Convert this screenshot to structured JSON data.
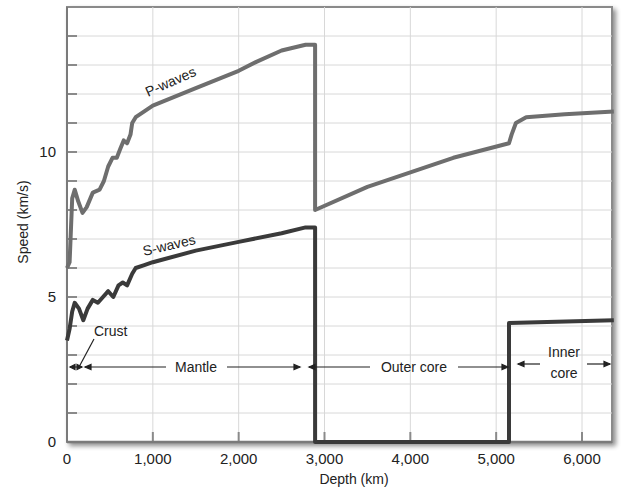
{
  "chart_data": {
    "type": "line",
    "title": "",
    "xlabel": "Depth (km)",
    "ylabel": "Speed (km/s)",
    "xlim": [
      0,
      6371
    ],
    "ylim": [
      0,
      15
    ],
    "grid": true,
    "x_ticks": [
      0,
      1000,
      2000,
      3000,
      4000,
      5000,
      6000
    ],
    "x_tick_labels": [
      "0",
      "1,000",
      "2,000",
      "3,000",
      "4,000",
      "5,000",
      "6,000"
    ],
    "y_ticks": [
      0,
      5,
      10
    ],
    "y_tick_labels": [
      "0",
      "5",
      "10"
    ],
    "y_minor_step": 1,
    "series": [
      {
        "name": "P-waves",
        "color": "#6e6e6e",
        "points": [
          [
            0,
            6.0
          ],
          [
            30,
            6.2
          ],
          [
            60,
            8.4
          ],
          [
            90,
            8.7
          ],
          [
            130,
            8.3
          ],
          [
            180,
            7.9
          ],
          [
            230,
            8.1
          ],
          [
            300,
            8.6
          ],
          [
            380,
            8.7
          ],
          [
            430,
            9.0
          ],
          [
            480,
            9.5
          ],
          [
            530,
            9.8
          ],
          [
            580,
            9.8
          ],
          [
            620,
            10.1
          ],
          [
            660,
            10.4
          ],
          [
            700,
            10.3
          ],
          [
            740,
            10.6
          ],
          [
            760,
            11.0
          ],
          [
            800,
            11.2
          ],
          [
            900,
            11.4
          ],
          [
            1000,
            11.6
          ],
          [
            1500,
            12.2
          ],
          [
            2000,
            12.8
          ],
          [
            2200,
            13.1
          ],
          [
            2500,
            13.5
          ],
          [
            2780,
            13.7
          ],
          [
            2800,
            13.7
          ],
          [
            2890,
            13.7
          ],
          [
            2890,
            8.0
          ],
          [
            3500,
            8.8
          ],
          [
            4500,
            9.8
          ],
          [
            5150,
            10.3
          ],
          [
            5180,
            10.6
          ],
          [
            5230,
            11.0
          ],
          [
            5350,
            11.2
          ],
          [
            5800,
            11.3
          ],
          [
            6371,
            11.4
          ]
        ]
      },
      {
        "name": "S-waves",
        "color": "#3a3a3a",
        "points": [
          [
            0,
            3.5
          ],
          [
            30,
            3.9
          ],
          [
            60,
            4.5
          ],
          [
            90,
            4.8
          ],
          [
            140,
            4.6
          ],
          [
            190,
            4.2
          ],
          [
            240,
            4.6
          ],
          [
            300,
            4.9
          ],
          [
            360,
            4.8
          ],
          [
            420,
            5.0
          ],
          [
            480,
            5.2
          ],
          [
            540,
            5.0
          ],
          [
            600,
            5.4
          ],
          [
            650,
            5.5
          ],
          [
            700,
            5.4
          ],
          [
            760,
            5.8
          ],
          [
            800,
            6.0
          ],
          [
            900,
            6.1
          ],
          [
            1000,
            6.2
          ],
          [
            1500,
            6.6
          ],
          [
            2000,
            6.9
          ],
          [
            2500,
            7.2
          ],
          [
            2780,
            7.4
          ],
          [
            2890,
            7.4
          ],
          [
            2890,
            0
          ],
          [
            5150,
            0
          ],
          [
            5150,
            4.1
          ],
          [
            6371,
            4.2
          ]
        ]
      }
    ],
    "annotations": {
      "crust": "Crust",
      "mantle": "Mantle",
      "outer_core": "Outer core",
      "inner_core_line1": "Inner",
      "inner_core_line2": "core"
    },
    "layers": [
      {
        "name": "Crust",
        "from": 0,
        "to": 40
      },
      {
        "name": "Mantle",
        "from": 40,
        "to": 2890
      },
      {
        "name": "Outer core",
        "from": 2890,
        "to": 5150
      },
      {
        "name": "Inner core",
        "from": 5150,
        "to": 6371
      }
    ]
  },
  "labels": {
    "p_waves": "P-waves",
    "s_waves": "S-waves",
    "x_axis": "Depth (km)",
    "y_axis": "Speed (km/s)",
    "x_ticks": [
      "0",
      "1,000",
      "2,000",
      "3,000",
      "4,000",
      "5,000",
      "6,000"
    ],
    "y_ticks": [
      "0",
      "5",
      "10"
    ],
    "crust": "Crust",
    "mantle": "Mantle",
    "outer_core": "Outer core",
    "inner_1": "Inner",
    "inner_2": "core"
  }
}
